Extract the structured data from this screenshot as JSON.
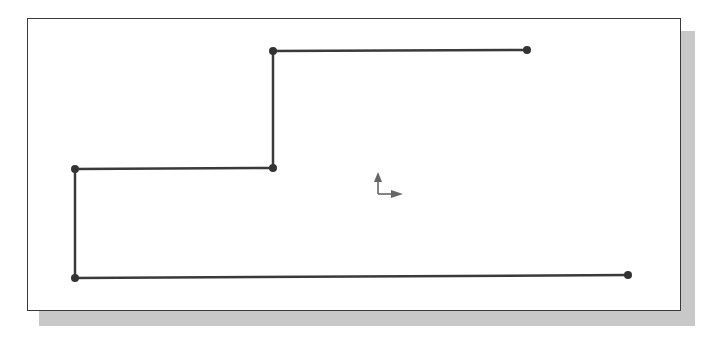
{
  "diagram": {
    "type": "sketch-polyline",
    "colors": {
      "line": "#3a3a3a",
      "point": "#333333",
      "axis": "#666666",
      "shadow": "#c8c8c8",
      "frame_border": "#3a3a3a"
    },
    "points": [
      {
        "x": 628,
        "y": 275
      },
      {
        "x": 75,
        "y": 278
      },
      {
        "x": 75,
        "y": 169
      },
      {
        "x": 273,
        "y": 168
      },
      {
        "x": 273,
        "y": 51
      },
      {
        "x": 527,
        "y": 50
      }
    ],
    "axis_indicator": {
      "origin": {
        "x": 378,
        "y": 194
      },
      "y_tip": {
        "x": 378,
        "y": 172
      },
      "x_tip": {
        "x": 403,
        "y": 194
      }
    }
  }
}
